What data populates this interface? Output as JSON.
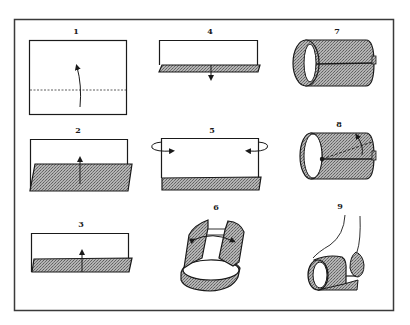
{
  "figure": {
    "type": "step-by-step folding instructions",
    "frame_color": "#3a3a3a",
    "shade_color": "#9a9a9a",
    "ink_color": "#1a1a1a",
    "background": "#ffffff"
  },
  "steps": [
    {
      "number": "1",
      "description": "Rectangle with dashed horizontal fold line; curved arrow indicates folding bottom edge upward"
    },
    {
      "number": "2",
      "description": "Bottom portion folded up, shaded flap with upward arrow"
    },
    {
      "number": "3",
      "description": "Narrower shaded fold strip at bottom with upward arrow"
    },
    {
      "number": "4",
      "description": "Thin shaded strip at bottom edge with downward arrow"
    },
    {
      "number": "5",
      "description": "Rectangle with shaded bottom band; curved arrows on both sides indicate rolling ends inward"
    },
    {
      "number": "6",
      "description": "Sheet curved into an open cylinder with double-headed arrow showing ends being brought together"
    },
    {
      "number": "7",
      "description": "Completed shaded cylinder with horizontal seam"
    },
    {
      "number": "8",
      "description": "Cylinder with dot at seam and diagonal line indicating a fold"
    },
    {
      "number": "9",
      "description": "Cylinder shaped with fingers pinching the end"
    }
  ]
}
